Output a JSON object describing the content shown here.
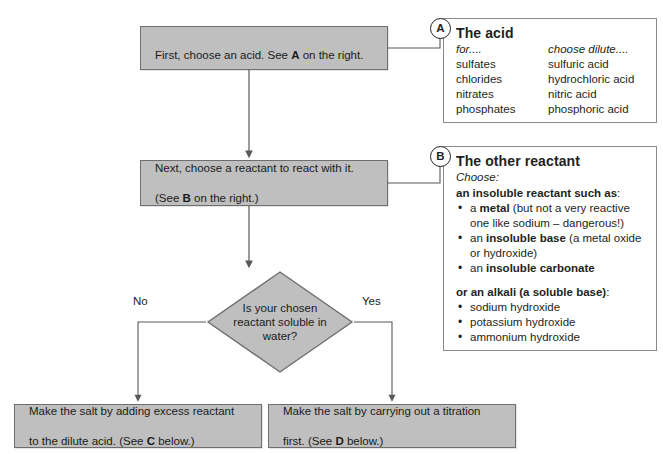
{
  "diagram": {
    "title_strip": "",
    "colors": {
      "node_fill": "#bfbfbf",
      "node_stroke": "#6e6e6e",
      "panel_stroke": "#8a8a8a",
      "connector": "#595959",
      "text": "#1b1b1b"
    },
    "nodes": [
      {
        "id": "box-acid",
        "type": "process",
        "text_plain": "First, choose an acid. See A on the right.",
        "text_pre": "First, choose an acid. See ",
        "text_bold": "A",
        "text_post": " on the right."
      },
      {
        "id": "box-reactant",
        "type": "process",
        "text_plain": "Next, choose a reactant to react with it. (See B on the right.)",
        "line1": "Next, choose a reactant to react with it.",
        "line2_pre": "(See ",
        "line2_bold": "B",
        "line2_post": " on the right.)"
      },
      {
        "id": "decision",
        "type": "decision",
        "text": "Is your chosen\nreactant soluble in\nwater?"
      },
      {
        "id": "box-excess",
        "type": "process",
        "text_plain": "Make the salt by adding excess reactant to the dilute acid. (See C below.)",
        "line1": "Make the salt by adding excess reactant",
        "line2_pre": "to the dilute acid. (See ",
        "line2_bold": "C",
        "line2_post": " below.)"
      },
      {
        "id": "box-titration",
        "type": "process",
        "text_plain": "Make the salt by carrying out a titration first. (See D below.)",
        "line1": "Make the salt by carrying out a titration",
        "line2_pre": "first. (See ",
        "line2_bold": "D",
        "line2_post": " below.)"
      }
    ],
    "branches": {
      "no_label": "No",
      "yes_label": "Yes"
    }
  },
  "panel_a": {
    "badge": "A",
    "title": "The acid",
    "columns": [
      "for....",
      "choose dilute...."
    ],
    "rows": [
      [
        "sulfates",
        "sulfuric acid"
      ],
      [
        "chlorides",
        "hydrochloric acid"
      ],
      [
        "nitrates",
        "nitric acid"
      ],
      [
        "phosphates",
        "phosphoric acid"
      ]
    ]
  },
  "panel_b": {
    "badge": "B",
    "title": "The other reactant",
    "choose_label": "Choose:",
    "group1_heading_bold": "an insoluble reactant such as",
    "group1_heading_tail": ":",
    "group1_items": [
      {
        "pre": "a ",
        "bold": "metal",
        "post": " (but not a very reactive one like sodium – dangerous!)"
      },
      {
        "pre": "an ",
        "bold": "insoluble base",
        "post": " (a metal oxide or hydroxide)"
      },
      {
        "pre": "an ",
        "bold": "insoluble carbonate",
        "post": ""
      }
    ],
    "group2_heading_bold": "or an alkali (a soluble base)",
    "group2_heading_tail": ":",
    "group2_items": [
      "sodium hydroxide",
      "potassium hydroxide",
      "ammonium hydroxide"
    ]
  }
}
